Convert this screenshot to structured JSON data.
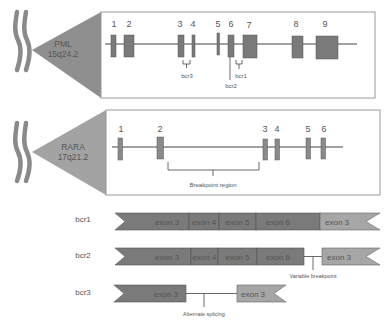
{
  "colors": {
    "exon_dark": "#7a7a7a",
    "exon_light": "#a6a6a6",
    "box_border": "#9a9a9a",
    "triangle": "#8f8f8f",
    "chromosome": "#8a8a8a",
    "line": "#444444"
  },
  "pml": {
    "gene": "PML",
    "locus": "15q24.2",
    "exons": [
      {
        "label": "1",
        "x": 111,
        "w": 5,
        "h": 22
      },
      {
        "label": "2",
        "x": 124,
        "w": 10,
        "h": 22
      },
      {
        "label": "3",
        "x": 178,
        "w": 6,
        "h": 22
      },
      {
        "label": "4",
        "x": 192,
        "w": 3,
        "h": 22
      },
      {
        "label": "5",
        "x": 217,
        "w": 2,
        "h": 22
      },
      {
        "label": "6",
        "x": 228,
        "w": 6,
        "h": 22
      },
      {
        "label": "7",
        "x": 243,
        "w": 14,
        "h": 24
      },
      {
        "label": "8",
        "x": 292,
        "w": 11,
        "h": 22
      },
      {
        "label": "9",
        "x": 316,
        "w": 22,
        "h": 23
      }
    ],
    "breakpoints": {
      "bcr1": "bcr1",
      "bcr2": "bcr2",
      "bcr3": "bcr3"
    }
  },
  "rara": {
    "gene": "RARA",
    "locus": "17q21.2",
    "exons": [
      {
        "label": "1",
        "x": 118,
        "w": 4
      },
      {
        "label": "2",
        "x": 157,
        "w": 6
      },
      {
        "label": "3",
        "x": 263,
        "w": 4
      },
      {
        "label": "4",
        "x": 275,
        "w": 4
      },
      {
        "label": "5",
        "x": 306,
        "w": 4
      },
      {
        "label": "6",
        "x": 321,
        "w": 4
      }
    ],
    "breakpoint_region_label": "Breakpoint region"
  },
  "transcripts": [
    {
      "name": "bcr1",
      "segments": [
        "exon 3",
        "exon 4",
        "exon 5",
        "exon 6",
        "exon 3"
      ]
    },
    {
      "name": "bcr2",
      "segments": [
        "exon 3",
        "exon 4",
        "exon 5",
        "exon 6",
        "exon 3"
      ],
      "annotation": "Variable breakpoint"
    },
    {
      "name": "bcr3",
      "segments": [
        "exon 3",
        "exon 3"
      ],
      "annotation": "Alternate splicing"
    }
  ]
}
